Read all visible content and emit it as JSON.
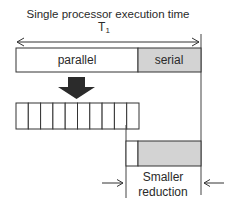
{
  "title": "Single processor execution time",
  "t_label": "T",
  "t_subscript": "1",
  "top_bar": {
    "parallel_label": "parallel",
    "serial_label": "serial"
  },
  "parallel_cells": 10,
  "bottom_label": {
    "line1": "Smaller",
    "line2": "reduction"
  },
  "colors": {
    "serial_fill": "#d3d3d3",
    "stroke": "#333333",
    "arrow_fill": "#2b2b2b"
  }
}
